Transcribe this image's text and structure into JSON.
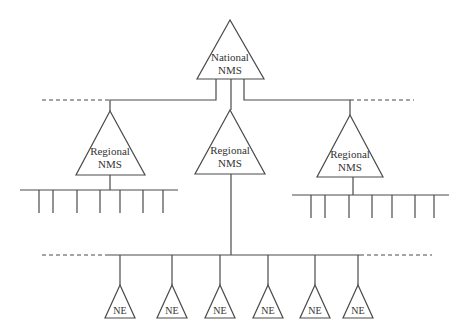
{
  "diagram": {
    "type": "hierarchy",
    "national": {
      "line1": "National",
      "line2": "NMS"
    },
    "regionals": [
      {
        "line1": "Regional",
        "line2": "NMS",
        "position": "left",
        "drops": 7
      },
      {
        "line1": "Regional",
        "line2": "NMS",
        "position": "center"
      },
      {
        "line1": "Regional",
        "line2": "NMS",
        "position": "right",
        "drops": 7
      }
    ],
    "network_elements": [
      {
        "label": "NE"
      },
      {
        "label": "NE"
      },
      {
        "label": "NE"
      },
      {
        "label": "NE"
      },
      {
        "label": "NE"
      },
      {
        "label": "NE"
      }
    ],
    "colors": {
      "line": "#4a4a4a",
      "text": "#333333",
      "background": "#ffffff"
    }
  }
}
